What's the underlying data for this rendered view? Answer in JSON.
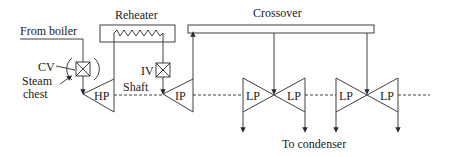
{
  "diagram": {
    "type": "steam-turbine-schematic",
    "labels": {
      "from_boiler": "From boiler",
      "cv": "CV",
      "steam_chest_line1": "Steam",
      "steam_chest_line2": "chest",
      "reheater": "Reheater",
      "iv": "IV",
      "crossover": "Crossover",
      "shaft": "Shaft",
      "to_condenser": "To condenser"
    },
    "turbines": [
      {
        "id": "hp",
        "label": "HP"
      },
      {
        "id": "ip",
        "label": "IP"
      },
      {
        "id": "lp1",
        "label": "LP"
      },
      {
        "id": "lp2",
        "label": "LP"
      },
      {
        "id": "lp3",
        "label": "LP"
      },
      {
        "id": "lp4",
        "label": "LP"
      }
    ],
    "valves": [
      {
        "id": "cv",
        "label": "CV"
      },
      {
        "id": "iv",
        "label": "IV"
      }
    ],
    "colors": {
      "stroke": "#2a2a2a",
      "text": "#1a1a1a",
      "background": "#ffffff"
    }
  }
}
